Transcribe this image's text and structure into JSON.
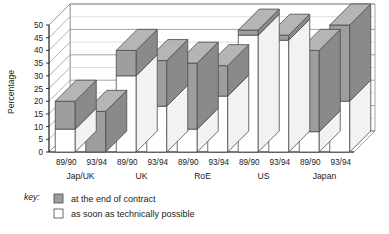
{
  "chart_data": {
    "type": "bar",
    "title": "",
    "subtitle": "",
    "xlabel": "",
    "ylabel": "Percentage",
    "ylim": [
      0,
      50
    ],
    "yticks": [
      0,
      5,
      10,
      15,
      20,
      25,
      30,
      35,
      40,
      45,
      50
    ],
    "grid": true,
    "stacked": true,
    "three_d": true,
    "legend_position": "bottom-left",
    "groups": [
      "Jap/UK",
      "UK",
      "RoE",
      "US",
      "Japan"
    ],
    "categories": [
      "89/90",
      "93/94",
      "89/90",
      "93/94",
      "89/90",
      "93/94",
      "89/90",
      "93/94",
      "89/90",
      "93/94"
    ],
    "series": [
      {
        "name": "as soon as technically possible",
        "fill": "#ffffff",
        "values": [
          9,
          0,
          30,
          18,
          9,
          22,
          46,
          44,
          8,
          20
        ]
      },
      {
        "name": "at the end of contract",
        "fill": "#9e9e9e",
        "values": [
          11,
          16,
          10,
          18,
          26,
          12,
          2,
          2,
          32,
          30
        ]
      }
    ],
    "totals": [
      20,
      16,
      40,
      36,
      35,
      34,
      48,
      46,
      40,
      50
    ],
    "bars": [
      {
        "group": "Jap/UK",
        "period": "89/90",
        "total": 20,
        "white": 9,
        "shaded": 11
      },
      {
        "group": "Jap/UK",
        "period": "93/94",
        "total": 16,
        "white": 0,
        "shaded": 16
      },
      {
        "group": "UK",
        "period": "89/90",
        "total": 40,
        "white": 30,
        "shaded": 10
      },
      {
        "group": "UK",
        "period": "93/94",
        "total": 36,
        "white": 18,
        "shaded": 18
      },
      {
        "group": "RoE",
        "period": "89/90",
        "total": 35,
        "white": 9,
        "shaded": 26
      },
      {
        "group": "RoE",
        "period": "93/94",
        "total": 34,
        "white": 22,
        "shaded": 12
      },
      {
        "group": "US",
        "period": "89/90",
        "total": 48,
        "white": 46,
        "shaded": 2
      },
      {
        "group": "US",
        "period": "93/94",
        "total": 46,
        "white": 44,
        "shaded": 2
      },
      {
        "group": "Japan",
        "period": "89/90",
        "total": 40,
        "white": 8,
        "shaded": 32
      },
      {
        "group": "Japan",
        "period": "93/94",
        "total": 50,
        "white": 20,
        "shaded": 30
      }
    ]
  },
  "legend": {
    "key_label": "key:",
    "items": [
      {
        "label": "at the end of contract",
        "swatch": "shaded"
      },
      {
        "label": "as soon as technically possible",
        "swatch": "white"
      }
    ]
  },
  "colors": {
    "shaded_front": "#9e9e9e",
    "shaded_top": "#b5b5b5",
    "shaded_side": "#8a8a8a",
    "white_face": "#ffffff",
    "outline": "#4a4a4a",
    "gridline": "#8e8e8e",
    "text": "#1b1b1b"
  }
}
